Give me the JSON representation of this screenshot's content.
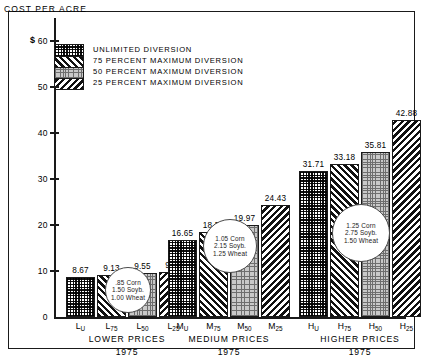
{
  "chart_data": {
    "type": "bar",
    "title": "COST PER ACRE",
    "xlabel": "",
    "ylabel": "$",
    "ylim": [
      0,
      65
    ],
    "yticks": [
      0,
      10,
      20,
      30,
      40,
      50,
      60
    ],
    "grid": false,
    "legend_position": "upper-left",
    "categories": [
      "LOWER PRICES 1975",
      "MEDIUM PRICES 1975",
      "HIGHER PRICES 1975"
    ],
    "series": [
      {
        "name": "UNLIMITED DIVERSION",
        "key": "U",
        "values": [
          8.67,
          16.65,
          31.71
        ]
      },
      {
        "name": "75 PERCENT MAXIMUM DIVERSION",
        "key": "75",
        "values": [
          9.13,
          18.53,
          33.18
        ]
      },
      {
        "name": "50 PERCENT MAXIMUM DIVERSION",
        "key": "50",
        "values": [
          9.55,
          19.97,
          35.81
        ]
      },
      {
        "name": "25 PERCENT MAXIMUM DIVERSION",
        "key": "25",
        "values": [
          9.72,
          24.43,
          42.88
        ]
      }
    ],
    "annotations": [
      {
        "group": "LOWER",
        "lines": [
          ".85 Corn",
          "1.50 Soyb.",
          "1.00 Wheat"
        ]
      },
      {
        "group": "MEDIUM",
        "lines": [
          "1.05 Corn",
          "2.15 Soyb.",
          "1.25 Wheat"
        ]
      },
      {
        "group": "HIGHER",
        "lines": [
          "1.25 Corn",
          "2.75 Soyb.",
          "1.50 Wheat"
        ]
      }
    ]
  },
  "axis": {
    "currency_symbol": "$",
    "ytick_labels": [
      "0",
      "10",
      "20",
      "30",
      "40",
      "50",
      "60"
    ]
  },
  "legend": {
    "items": [
      {
        "label": "UNLIMITED  DIVERSION",
        "pattern": "checker"
      },
      {
        "label": "75 PERCENT  MAXIMUM DIVERSION",
        "pattern": "diagonal-right"
      },
      {
        "label": "50 PERCENT  MAXIMUM DIVERSION",
        "pattern": "gray-grid"
      },
      {
        "label": "25 PERCENT  MAXIMUM DIVERSION",
        "pattern": "diagonal-left"
      }
    ]
  },
  "groups": [
    {
      "caption": "LOWER  PRICES",
      "year": "1975",
      "ticks": [
        {
          "base": "L",
          "sub": "U"
        },
        {
          "base": "L",
          "sub": "75"
        },
        {
          "base": "L",
          "sub": "50"
        },
        {
          "base": "L",
          "sub": "25"
        }
      ],
      "values": [
        "8.67",
        "9.13",
        "9.55",
        "9.72"
      ],
      "callout": {
        "l1": ".85 Corn",
        "l2": "1.50 Soyb.",
        "l3": "1.00 Wheat"
      }
    },
    {
      "caption": "MEDIUM  PRICES",
      "year": "1975",
      "ticks": [
        {
          "base": "M",
          "sub": "U"
        },
        {
          "base": "M",
          "sub": "75"
        },
        {
          "base": "M",
          "sub": "50"
        },
        {
          "base": "M",
          "sub": "25"
        }
      ],
      "values": [
        "16.65",
        "18.53",
        "19.97",
        "24.43"
      ],
      "callout": {
        "l1": "1.05 Corn",
        "l2": "2.15 Soyb.",
        "l3": "1.25 Wheat"
      }
    },
    {
      "caption": "HIGHER  PRICES",
      "year": "1975",
      "ticks": [
        {
          "base": "H",
          "sub": "U"
        },
        {
          "base": "H",
          "sub": "75"
        },
        {
          "base": "H",
          "sub": "50"
        },
        {
          "base": "H",
          "sub": "25"
        }
      ],
      "values": [
        "31.71",
        "33.18",
        "35.81",
        "42.88"
      ],
      "callout": {
        "l1": "1.25 Corn",
        "l2": "2.75 Soyb.",
        "l3": "1.50 Wheat"
      }
    }
  ]
}
